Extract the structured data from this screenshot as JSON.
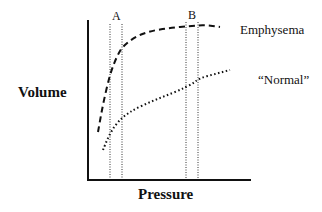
{
  "chart_data": {
    "type": "line",
    "title": "",
    "xlabel": "Pressure",
    "ylabel": "Volume",
    "grid": false,
    "markers": [
      {
        "label": "A",
        "lines_x_px": [
          110,
          122
        ]
      },
      {
        "label": "B",
        "lines_x_px": [
          186,
          198
        ]
      }
    ],
    "series": [
      {
        "name": "Emphysema",
        "style": "dashed",
        "points_px": [
          [
            98,
            132
          ],
          [
            103,
            104
          ],
          [
            110,
            74
          ],
          [
            117,
            56
          ],
          [
            123,
            46
          ],
          [
            135,
            37
          ],
          [
            150,
            31
          ],
          [
            170,
            28
          ],
          [
            190,
            26
          ],
          [
            205,
            25
          ],
          [
            220,
            27
          ]
        ]
      },
      {
        "name": "“Normal”",
        "style": "dotted",
        "points_px": [
          [
            103,
            150
          ],
          [
            107,
            140
          ],
          [
            112,
            130
          ],
          [
            118,
            122
          ],
          [
            124,
            116
          ],
          [
            135,
            109
          ],
          [
            150,
            102
          ],
          [
            165,
            96
          ],
          [
            180,
            90
          ],
          [
            192,
            84
          ],
          [
            200,
            78
          ],
          [
            215,
            74
          ],
          [
            230,
            70
          ]
        ]
      }
    ],
    "axes": {
      "origin_px": [
        88,
        180
      ],
      "y_top_px": 20,
      "x_right_px": 251
    }
  },
  "labels": {
    "ylabel": "Volume",
    "xlabel": "Pressure",
    "marker_a": "A",
    "marker_b": "B",
    "series_emphysema": "Emphysema",
    "series_normal": "“Normal”"
  }
}
